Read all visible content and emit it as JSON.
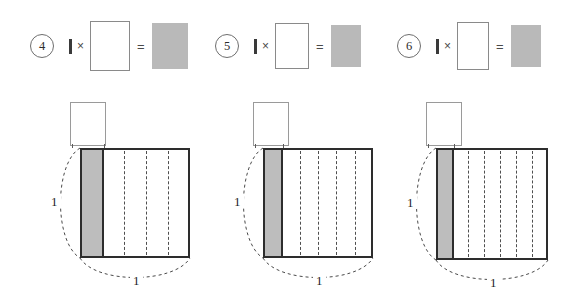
{
  "page": {
    "background": "#ffffff",
    "width": 570,
    "height": 286
  },
  "colors": {
    "shaded_gray": "#bdbdbd",
    "product_gray": "#b9b9b9",
    "outline_dark": "#2d2d2d",
    "outline_light": "#8a8a8a",
    "dashed_gray": "#4f4f4f",
    "text": "#1f1f1f"
  },
  "equations": [
    {
      "number": "4",
      "unit_glyph": "1",
      "times_symbol": "×",
      "equals_symbol": "=",
      "blank_answer": "",
      "product_fill": "#b9b9b9",
      "left": 30,
      "blank_w": 38,
      "blank_h": 48,
      "gray_w": 36,
      "gray_h": 46
    },
    {
      "number": "5",
      "unit_glyph": "1",
      "times_symbol": "×",
      "equals_symbol": "=",
      "blank_answer": "",
      "product_fill": "#b9b9b9",
      "left": 215,
      "blank_w": 32,
      "blank_h": 44,
      "gray_w": 30,
      "gray_h": 42
    },
    {
      "number": "6",
      "unit_glyph": "1",
      "times_symbol": "×",
      "equals_symbol": "=",
      "blank_answer": "",
      "product_fill": "#b9b9b9",
      "left": 397,
      "blank_w": 30,
      "blank_h": 46,
      "gray_w": 30,
      "gray_h": 42
    }
  ],
  "diagrams": [
    {
      "id": "diagram-4",
      "eq_number": "4",
      "divisions": 5,
      "dashed_line_count": 4,
      "shaded_columns": 1,
      "height_label": "1",
      "width_label": "1",
      "answer_box_value": "",
      "left": 62,
      "square_left": 18,
      "square_top": 56,
      "square_size": 110,
      "answer_left": 8,
      "answer_top": 10,
      "answer_w": 34,
      "answer_h": 42
    },
    {
      "id": "diagram-5",
      "eq_number": "5",
      "divisions": 6,
      "dashed_line_count": 5,
      "shaded_columns": 1,
      "height_label": "1",
      "width_label": "1",
      "answer_box_value": "",
      "left": 245,
      "square_left": 18,
      "square_top": 56,
      "square_size": 110,
      "answer_left": 8,
      "answer_top": 10,
      "answer_w": 34,
      "answer_h": 42
    },
    {
      "id": "diagram-6",
      "eq_number": "6",
      "divisions": 7,
      "dashed_line_count": 6,
      "shaded_columns": 1,
      "height_label": "1",
      "width_label": "1",
      "answer_box_value": "",
      "left": 418,
      "square_left": 18,
      "square_top": 56,
      "square_size": 112,
      "answer_left": 8,
      "answer_top": 10,
      "answer_w": 34,
      "answer_h": 42
    }
  ]
}
